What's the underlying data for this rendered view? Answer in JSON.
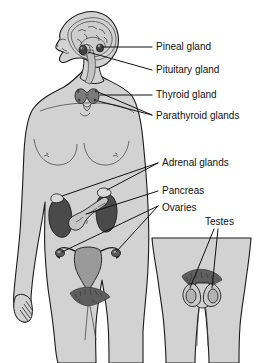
{
  "figure": {
    "background_color": "#ffffff",
    "body_fill": "#d2d2d2",
    "body_outline": "#1a1a1a",
    "organ_dark": "#4a4a4a",
    "organ_mid": "#8f8f8f",
    "organ_light": "#c8c8c8",
    "label_color": "#111111",
    "leader_color": "#111111"
  },
  "labels": [
    {
      "id": "pineal",
      "text": "Pineal gland",
      "x": 156,
      "y": 47
    },
    {
      "id": "pituitary",
      "text": "Pituitary gland",
      "x": 156,
      "y": 70
    },
    {
      "id": "thyroid",
      "text": "Thyroid gland",
      "x": 156,
      "y": 95
    },
    {
      "id": "parathyroid",
      "text": "Parathyroid glands",
      "x": 156,
      "y": 116
    },
    {
      "id": "adrenal",
      "text": "Adrenal glands",
      "x": 162,
      "y": 163
    },
    {
      "id": "pancreas",
      "text": "Pancreas",
      "x": 162,
      "y": 191
    },
    {
      "id": "ovaries",
      "text": "Ovaries",
      "x": 162,
      "y": 208
    },
    {
      "id": "testes",
      "text": "Testes",
      "x": 205,
      "y": 222
    }
  ],
  "figures": {
    "main_figure_caption": "Female body, front view",
    "inset_caption": "Male pelvis, front view"
  }
}
